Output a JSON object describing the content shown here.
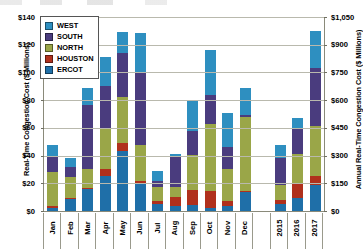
{
  "chart_data": {
    "type": "bar",
    "subtype": "stacked-column",
    "title": "",
    "xlabel": "",
    "ylabel": "Real-Time Congestion Cost ($ Millions)",
    "y2label": "Annual Real-Time Congestion Cost ($ Millions)",
    "categories": [
      "Jan",
      "Feb",
      "Mar",
      "Apr",
      "May",
      "Jun",
      "Jul",
      "Aug",
      "Sep",
      "Oct",
      "Nov",
      "Dec",
      "",
      "2015",
      "2016",
      "2017"
    ],
    "ylim": [
      0,
      140
    ],
    "yticks": [
      0,
      20,
      40,
      60,
      80,
      100,
      120,
      140
    ],
    "ytick_labels": [
      "$0",
      "$20",
      "$40",
      "$60",
      "$80",
      "$100",
      "$120",
      "$140"
    ],
    "y2lim": [
      0,
      1050
    ],
    "y2ticks": [
      0,
      150,
      300,
      450,
      600,
      750,
      900,
      1050
    ],
    "y2tick_labels": [
      "$0",
      "$150",
      "$300",
      "$450",
      "$600",
      "$750",
      "$900",
      "$1,050"
    ],
    "grid": true,
    "legend_position": "upper-left",
    "series": [
      {
        "name": "ERCOT",
        "color": "#1F6FA8",
        "values": [
          2.5,
          8.5,
          16.0,
          25.0,
          43.0,
          20.0,
          5.0,
          3.5,
          4.0,
          2.5,
          3.5,
          14.0,
          null,
          5.0,
          9.5,
          19.0
        ]
      },
      {
        "name": "HOUSTON",
        "color": "#B0301C",
        "values": [
          1.0,
          0.6,
          0.8,
          5.5,
          6.0,
          2.0,
          2.0,
          6.5,
          11.0,
          12.0,
          4.0,
          0.5,
          null,
          3.0,
          11.0,
          6.5
        ]
      },
      {
        "name": "NORTH",
        "color": "#9AA648",
        "values": [
          24.5,
          15.5,
          13.5,
          29.0,
          33.0,
          26.0,
          10.5,
          7.0,
          25.5,
          48.0,
          23.0,
          53.0,
          null,
          10.5,
          20.5,
          35.5
        ]
      },
      {
        "name": "SOUTH",
        "color": "#4A3C7E",
        "values": [
          12.0,
          7.5,
          46.5,
          31.0,
          32.0,
          52.0,
          4.5,
          22.5,
          17.0,
          21.5,
          15.5,
          2.0,
          null,
          19.5,
          18.0,
          42.0
        ]
      },
      {
        "name": "WEST",
        "color": "#2E8FC0",
        "values": [
          8.0,
          6.5,
          12.0,
          21.0,
          15.0,
          28.5,
          7.0,
          2.0,
          23.0,
          32.5,
          24.5,
          19.5,
          null,
          10.0,
          8.0,
          27.0
        ]
      }
    ],
    "totals": [
      48.0,
      38.6,
      88.8,
      111.5,
      129.0,
      128.5,
      29.0,
      41.5,
      80.5,
      116.5,
      70.5,
      89.0,
      null,
      48.0,
      67.0,
      130.0
    ],
    "annual_totals_right_axis": [
      360,
      502,
      975
    ],
    "note": "Monthly bars (Jan-Dec) read on left axis; 2015/2016/2017 bars are annual totals read on right axis."
  },
  "legend": {
    "items": [
      {
        "label": "WEST",
        "color": "#2E8FC0"
      },
      {
        "label": "SOUTH",
        "color": "#4A3C7E"
      },
      {
        "label": "NORTH",
        "color": "#9AA648"
      },
      {
        "label": "HOUSTON",
        "color": "#B0301C"
      },
      {
        "label": "ERCOT",
        "color": "#1F6FA8"
      }
    ]
  }
}
